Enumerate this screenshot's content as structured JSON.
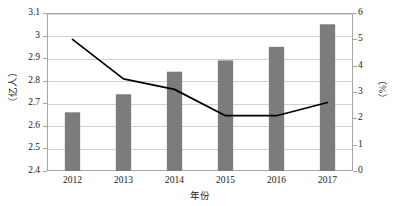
{
  "chart_data": {
    "type": "bar",
    "title": "",
    "xlabel": "年份",
    "categories": [
      "2012",
      "2013",
      "2014",
      "2015",
      "2016",
      "2017"
    ],
    "series": [
      {
        "name": "人数",
        "type": "bar",
        "axis": "left",
        "unit": "亿人",
        "values": [
          2.66,
          2.74,
          2.84,
          2.89,
          2.95,
          3.05
        ],
        "color": "#7c7c7c"
      },
      {
        "name": "增长率",
        "type": "line",
        "axis": "right",
        "unit": "%",
        "values": [
          5.0,
          3.5,
          3.1,
          2.1,
          2.1,
          2.6
        ],
        "color": "#000000"
      }
    ],
    "left_axis": {
      "label": "（亿人）",
      "ylim": [
        2.4,
        3.1
      ],
      "ticks": [
        "2.4",
        "2.5",
        "2.6",
        "2.7",
        "2.8",
        "2.9",
        "3",
        "3.1"
      ]
    },
    "right_axis": {
      "label": "（%）",
      "ylim": [
        0,
        6
      ],
      "ticks": [
        "0",
        "1",
        "2",
        "3",
        "4",
        "5",
        "6"
      ]
    },
    "grid": true,
    "legend": "none"
  }
}
